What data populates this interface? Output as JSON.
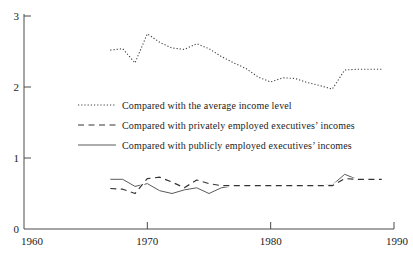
{
  "figure": {
    "background": "#ffffff",
    "axis_color": "#4a4a4a",
    "text_color": "#1c1c1c",
    "white": "#ffffff"
  },
  "axes": {
    "x": {
      "min": 1960,
      "max": 1990,
      "ticks": [
        1960,
        1970,
        1980,
        1990
      ],
      "tick_labels": [
        "1960",
        "1970",
        "1980",
        "1990"
      ]
    },
    "y": {
      "min": 0,
      "max": 3,
      "ticks": [
        0,
        1,
        2,
        3
      ],
      "tick_labels": [
        "0",
        "1",
        "2",
        "3"
      ]
    }
  },
  "chart_data": {
    "type": "line",
    "title": "",
    "xlabel": "",
    "ylabel": "",
    "xlim": [
      1960,
      1990
    ],
    "ylim": [
      0,
      3
    ],
    "grid": false,
    "legend_position": "inside middle-left",
    "x": [
      1967,
      1968,
      1969,
      1970,
      1971,
      1972,
      1973,
      1974,
      1975,
      1976,
      1977,
      1978,
      1979,
      1980,
      1981,
      1982,
      1983,
      1984,
      1985,
      1986,
      1987,
      1988,
      1989
    ],
    "series": [
      {
        "name": "Compared with the average income level",
        "line_style": "dotted",
        "color": "#3f3f3f",
        "values": [
          2.52,
          2.54,
          2.34,
          2.75,
          2.63,
          2.55,
          2.53,
          2.61,
          2.54,
          2.43,
          2.34,
          2.26,
          2.14,
          2.07,
          2.13,
          2.12,
          2.06,
          2.02,
          1.97,
          2.24,
          2.25,
          2.25,
          2.25
        ]
      },
      {
        "name": "Compared with privately employed executives’ incomes",
        "line_style": "dashed",
        "color": "#343434",
        "values": [
          0.57,
          0.56,
          0.5,
          0.71,
          0.73,
          0.66,
          0.58,
          0.69,
          0.64,
          0.61,
          0.61,
          0.61,
          0.61,
          0.61,
          0.61,
          0.61,
          0.61,
          0.61,
          0.61,
          0.71,
          0.7,
          0.7,
          0.7
        ]
      },
      {
        "name": "Compared with publicly employed executives’ incomes",
        "line_style": "solid",
        "color": "#5a5a5a",
        "values": [
          0.7,
          0.7,
          0.6,
          0.64,
          0.54,
          0.5,
          0.55,
          0.58,
          0.5,
          0.58,
          0.61,
          0.61,
          0.61,
          0.61,
          0.61,
          0.61,
          0.61,
          0.61,
          0.62,
          0.77,
          0.7,
          0.7,
          0.7
        ]
      }
    ]
  }
}
